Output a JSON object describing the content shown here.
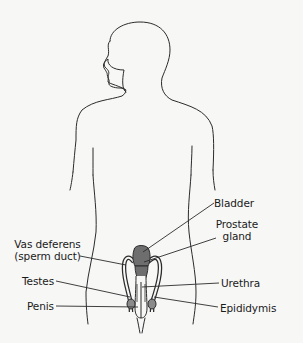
{
  "diagram": {
    "type": "anatomical-illustration",
    "colors": {
      "background": "#f7f7f6",
      "outline": "#2b2b2b",
      "organ_fill": "#6e6e6e",
      "label_text": "#1a1a1a"
    },
    "labels": {
      "bladder": "Bladder",
      "prostate_line1": "Prostate",
      "prostate_line2": "gland",
      "vas_line1": "Vas deferens",
      "vas_line2": "(sperm duct)",
      "testes": "Testes",
      "penis": "Penis",
      "urethra": "Urethra",
      "epididymis": "Epididymis"
    }
  }
}
